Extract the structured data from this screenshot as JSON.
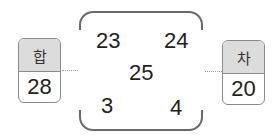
{
  "frame": {
    "numbers": {
      "top_left": "23",
      "top_right": "24",
      "center": "25",
      "bottom_left": "3",
      "bottom_right": "4"
    }
  },
  "sum_box": {
    "label": "합",
    "value": "28"
  },
  "diff_box": {
    "label": "차",
    "value": "20"
  },
  "colors": {
    "header_bg": "#dcdcdc",
    "border": "#6a6a6a"
  }
}
